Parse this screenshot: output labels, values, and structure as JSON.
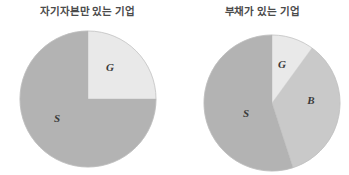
{
  "figure": {
    "background": "#ffffff",
    "width": 349,
    "height": 175
  },
  "panels": [
    {
      "id": "equity",
      "title": "자기자본만 있는 기업",
      "title_color": "#4b4b4b"
    },
    {
      "id": "debt",
      "title": "부채가 있는 기업",
      "title_color": "#4b4b4b"
    }
  ],
  "labels": {
    "equity_g": "G",
    "equity_s": "S",
    "debt_g": "G",
    "debt_b": "B",
    "debt_s": "S"
  },
  "colors": {
    "g_light": "#e9e9e9",
    "b_mid": "#c9c9c9",
    "s_dark": "#b3b3b3",
    "outline": "#bdbdbd",
    "text": "#3a3a3a"
  },
  "chart_data": [
    {
      "type": "pie",
      "title": "자기자본만 있는 기업",
      "labels": [
        "G",
        "S"
      ],
      "values": [
        25,
        75
      ],
      "unit": "percent",
      "start_angle_deg": 0,
      "direction": "clockwise",
      "colors": [
        "#e9e9e9",
        "#b3b3b3"
      ],
      "center": [
        88,
        99
      ],
      "radius": 68,
      "legend": "none",
      "grid": false,
      "annotations": [
        {
          "text": "G",
          "x": 110,
          "y": 67
        },
        {
          "text": "S",
          "x": 57,
          "y": 118
        }
      ]
    },
    {
      "type": "pie",
      "title": "부채가 있는 기업",
      "labels": [
        "G",
        "B",
        "S"
      ],
      "values": [
        10,
        35,
        55
      ],
      "unit": "percent",
      "start_angle_deg": 0,
      "direction": "clockwise",
      "colors": [
        "#e9e9e9",
        "#c9c9c9",
        "#b3b3b3"
      ],
      "center": [
        272,
        103
      ],
      "radius": 68,
      "legend": "none",
      "grid": false,
      "annotations": [
        {
          "text": "G",
          "x": 282,
          "y": 64
        },
        {
          "text": "B",
          "x": 311,
          "y": 100
        },
        {
          "text": "S",
          "x": 246,
          "y": 113
        }
      ]
    }
  ]
}
